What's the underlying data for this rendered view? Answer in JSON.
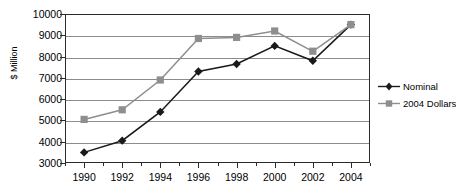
{
  "chart_data": {
    "type": "line",
    "title": "",
    "xlabel": "",
    "ylabel": "$ Million",
    "x": [
      1990,
      1992,
      1994,
      1996,
      1998,
      2000,
      2002,
      2004
    ],
    "categories": [
      "1990",
      "1992",
      "1994",
      "1996",
      "1998",
      "2000",
      "2002",
      "2004"
    ],
    "xlim": [
      1989,
      2005
    ],
    "ylim": [
      3000,
      10000
    ],
    "ytick_labels": [
      "10000",
      "9000",
      "8000",
      "7000",
      "6000",
      "5000",
      "4000",
      "3000"
    ],
    "ytick_values": [
      10000,
      9000,
      8000,
      7000,
      6000,
      5000,
      4000,
      3000
    ],
    "grid": true,
    "legend_position": "right",
    "series": [
      {
        "name": "Nominal",
        "color": "#1a1a1a",
        "marker": "diamond",
        "values": [
          3500,
          4050,
          5400,
          7300,
          7650,
          8500,
          7800,
          9500
        ]
      },
      {
        "name": "2004 Dollars",
        "color": "#8e8e8e",
        "marker": "square",
        "values": [
          5050,
          5500,
          6900,
          8850,
          8900,
          9200,
          8250,
          9500
        ]
      }
    ]
  },
  "legend": {
    "items": [
      {
        "label": "Nominal",
        "color": "#1a1a1a",
        "marker": "diamond"
      },
      {
        "label": "2004 Dollars",
        "color": "#8e8e8e",
        "marker": "square"
      }
    ]
  },
  "axes": {
    "y_title": "$ Million"
  }
}
